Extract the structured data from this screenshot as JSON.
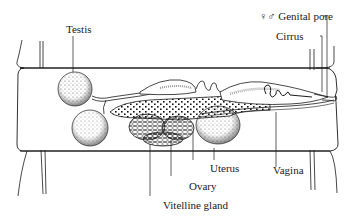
{
  "figure": {
    "type": "anatomical line drawing",
    "colors": {
      "ink": "#1a1a1a",
      "background": "#ffffff"
    }
  },
  "labels": {
    "testis": "Testis",
    "genital_pore": "♀♂ Genital pore",
    "cirrus": "Cirrus",
    "uterus": "Uterus",
    "vagina": "Vagina",
    "ovary": "Ovary",
    "vitelline_gland": "Vitelline gland"
  }
}
